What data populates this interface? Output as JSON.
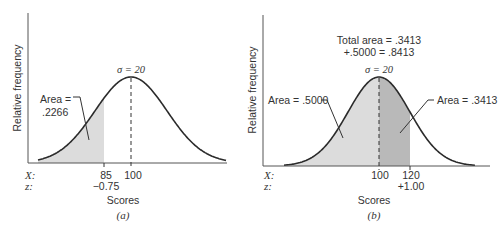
{
  "chart_data": [
    {
      "type": "area",
      "panel": "(a)",
      "title": "",
      "xlabel": "Scores",
      "ylabel": "Relative frequency",
      "distribution": "normal",
      "mean": 100,
      "sigma": 20,
      "sigma_label": "σ = 20",
      "x_ticks": [
        {
          "X": 85,
          "z": "−0.75"
        },
        {
          "X": 100,
          "z": ""
        }
      ],
      "row_labels": {
        "X": "X:",
        "z": "z:"
      },
      "shaded_region": {
        "from": "-inf",
        "to": 85,
        "area": ".2266"
      },
      "annotation": "Area = .2266",
      "annotation_lines": [
        "Area =",
        ".2266"
      ],
      "caption": "(a)",
      "grid": false
    },
    {
      "type": "area",
      "panel": "(b)",
      "title": "",
      "xlabel": "Scores",
      "ylabel": "Relative frequency",
      "distribution": "normal",
      "mean": 100,
      "sigma": 20,
      "sigma_label": "σ = 20",
      "x_ticks": [
        {
          "X": 100,
          "z": ""
        },
        {
          "X": 120,
          "z": "+1.00"
        }
      ],
      "row_labels": {
        "X": "X:",
        "z": "z:"
      },
      "shaded_regions": [
        {
          "from": "-inf",
          "to": 100,
          "area": ".5000",
          "label": "Area = .5000"
        },
        {
          "from": 100,
          "to": 120,
          "area": ".3413",
          "label": "Area = .3413"
        }
      ],
      "total_area_lines": [
        "Total area = .3413",
        "+.5000 = .8413"
      ],
      "total_area": ".8413",
      "caption": "(b)",
      "grid": false
    }
  ],
  "colors": {
    "curve": "#2b2b2b",
    "axis": "#555555",
    "light_fill": "#dcdcdc",
    "dark_fill": "#b9b9b9"
  }
}
